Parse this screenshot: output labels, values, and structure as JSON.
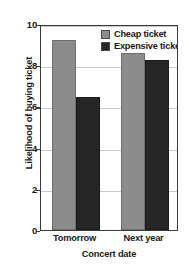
{
  "chart_data": {
    "type": "bar",
    "title": "",
    "xlabel": "Concert date",
    "ylabel": "Likelihood of buying ticket",
    "categories": [
      "Tomorrow",
      "Next year"
    ],
    "series": [
      {
        "name": "Cheap ticket",
        "values": [
          9.2,
          8.6
        ],
        "color": "#8c8c8c"
      },
      {
        "name": "Expensive ticket",
        "values": [
          6.45,
          8.25
        ],
        "color": "#262626"
      }
    ],
    "ylim": [
      0,
      10
    ],
    "yticks": [
      0,
      2,
      4,
      6,
      8,
      10
    ],
    "ytick_labels": [
      "0",
      "2",
      "4",
      "6",
      "8",
      "10"
    ],
    "grid": "horizontal",
    "legend_position": "top-right-inside",
    "axis_color": "#3b3b3b",
    "gridline_color": "#c9c9c9",
    "background": "#ffffff"
  }
}
